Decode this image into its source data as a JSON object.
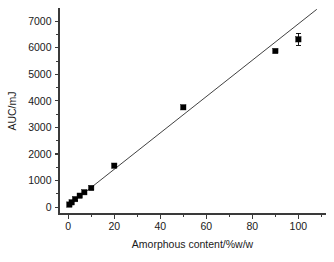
{
  "chart_data": {
    "type": "scatter",
    "title": "",
    "xlabel": "Amorphous content/%w/w",
    "ylabel": "AUC/mJ",
    "xlim": [
      -4,
      112
    ],
    "ylim": [
      -260,
      7500
    ],
    "grid": false,
    "legend": null,
    "x_ticks_major": [
      0,
      20,
      40,
      60,
      80,
      100
    ],
    "x_tick_labels": [
      "0",
      "20",
      "40",
      "60",
      "80",
      "100"
    ],
    "x_ticks_minor": [
      10,
      30,
      50,
      70,
      90,
      110
    ],
    "y_ticks_major": [
      0,
      1000,
      2000,
      3000,
      4000,
      5000,
      6000,
      7000
    ],
    "y_tick_labels": [
      "0",
      "1000",
      "2000",
      "3000",
      "4000",
      "5000",
      "6000",
      "7000"
    ],
    "y_ticks_minor": [
      500,
      1500,
      2500,
      3500,
      4500,
      5500,
      6500
    ],
    "series": [
      {
        "name": "AUC vs amorphous content",
        "marker": "filled-square",
        "color": "#000000",
        "points": [
          {
            "x": 0.5,
            "y": 95,
            "yerr": 40
          },
          {
            "x": 1.5,
            "y": 180,
            "yerr": 35
          },
          {
            "x": 3,
            "y": 300,
            "yerr": 35
          },
          {
            "x": 5,
            "y": 430,
            "yerr": 35
          },
          {
            "x": 7,
            "y": 560,
            "yerr": 35
          },
          {
            "x": 10,
            "y": 720,
            "yerr": 40
          },
          {
            "x": 20,
            "y": 1560,
            "yerr": 45
          },
          {
            "x": 50,
            "y": 3760,
            "yerr": 55
          },
          {
            "x": 90,
            "y": 5880,
            "yerr": 60
          },
          {
            "x": 100,
            "y": 6320,
            "yerr": 220
          }
        ]
      }
    ],
    "fit_line": {
      "name": "linear regression",
      "color": "#2b2b2b",
      "x_start": 0,
      "y_start": 55,
      "x_end": 108,
      "y_end": 7450
    }
  },
  "axes": {
    "y_title": "AUC/mJ",
    "x_title": "Amorphous content/%w/w"
  }
}
